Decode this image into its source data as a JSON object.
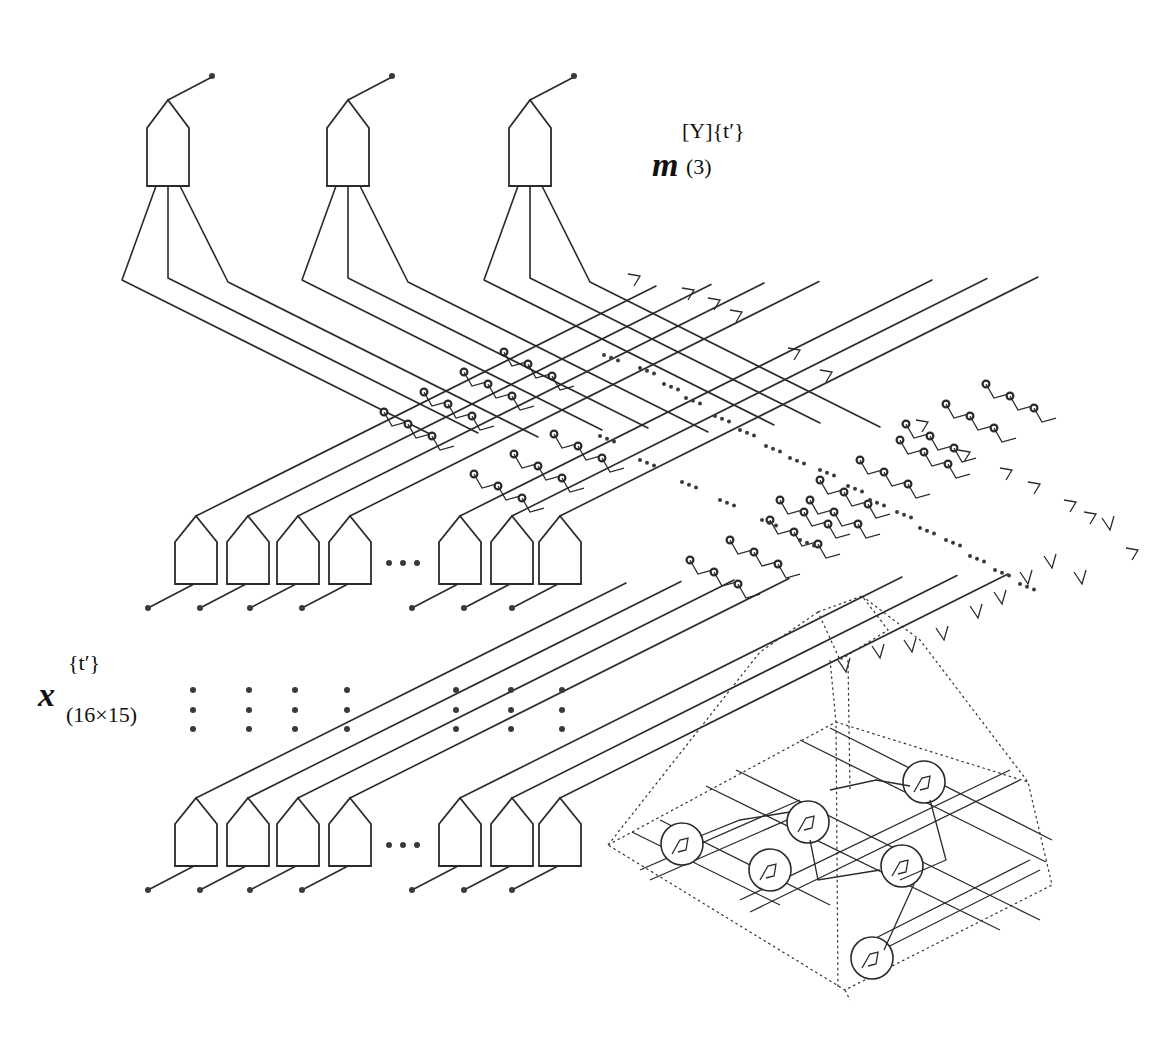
{
  "figure": {
    "colors": {
      "line": "#2a2a2a",
      "background": "#ffffff"
    }
  },
  "labels": {
    "output": {
      "symbol": "m",
      "superscript": "[Y]{t′}",
      "subscript": "(3)"
    },
    "input": {
      "symbol": "x",
      "superscript": "{t′}",
      "subscript": "(16×15)"
    }
  },
  "output_units": {
    "count": 3,
    "icon": "pentagon-unit-icon"
  },
  "input_rows": [
    {
      "name": "input-row-1",
      "visible_units": 7,
      "ellipsis": "•••"
    },
    {
      "name": "input-row-2",
      "visible_units": 7,
      "ellipsis": "•••"
    }
  ],
  "vertical_ellipsis_columns": 7,
  "inset": {
    "name": "magnified-mesh-detail",
    "visible_nodes": 6
  }
}
